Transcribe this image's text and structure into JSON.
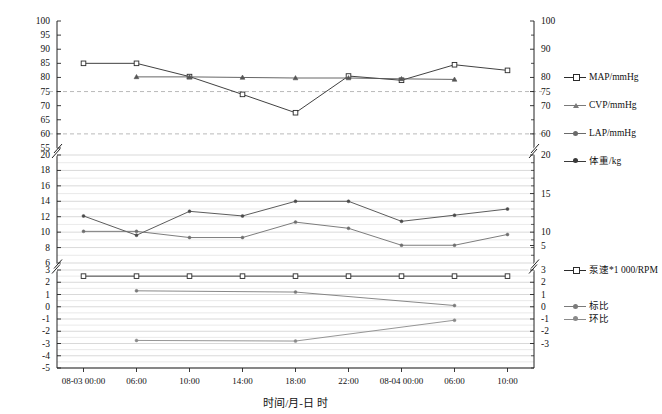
{
  "chart_data": {
    "type": "line",
    "title": "",
    "xlabel": "时间/月-日 时",
    "ylabel": "",
    "grid": true,
    "legend_position": "right",
    "broken_axis": true,
    "panels": [
      {
        "name": "blood-pressure",
        "ylim": [
          55,
          100
        ],
        "yticks": [
          55,
          60,
          65,
          70,
          75,
          80,
          85,
          90,
          95,
          100
        ],
        "yticks_right": [
          60,
          70,
          75,
          80,
          90,
          100
        ],
        "reference_lines": [
          75,
          60
        ]
      },
      {
        "name": "lap-weight",
        "ylim": [
          6,
          20
        ],
        "yticks": [
          6,
          8,
          10,
          12,
          14,
          16,
          18,
          20
        ],
        "yticks_right": [
          10,
          15,
          20
        ]
      },
      {
        "name": "pump-ratio",
        "ylim": [
          -5,
          3
        ],
        "yticks": [
          -5,
          -4,
          -3,
          -2,
          -1,
          0,
          1,
          2,
          3
        ],
        "yticks_right": [
          -3,
          -2,
          -1,
          0,
          1,
          2,
          3,
          5
        ]
      }
    ],
    "categories": [
      "08-03 00:00",
      "06:00",
      "10:00",
      "14:00",
      "18:00",
      "22:00",
      "08-04 00:00",
      "06:00",
      "10:00"
    ],
    "series": [
      {
        "name": "MAP/mmHg",
        "panel": "blood-pressure",
        "marker": "square",
        "color": "#2b2b2b",
        "values": [
          85,
          85,
          80.3,
          74,
          67.5,
          80.5,
          79,
          84.5,
          82.5
        ]
      },
      {
        "name": "CVP/mmHg",
        "panel": "blood-pressure",
        "marker": "triangle",
        "color": "#555555",
        "values": [
          null,
          80.2,
          80.2,
          80,
          79.8,
          79.8,
          79.5,
          79.3,
          null
        ]
      },
      {
        "name": "LAP/mmHg",
        "panel": "lap-weight",
        "marker": "dot",
        "color": "#4a4a4a",
        "values": [
          12.1,
          9.6,
          12.7,
          12.1,
          14,
          14,
          11.4,
          12.2,
          13
        ]
      },
      {
        "name": "体重/kg",
        "panel": "lap-weight",
        "marker": "dot",
        "color": "#6e6e6e",
        "values": [
          10.1,
          10.1,
          9.3,
          9.3,
          11.3,
          10.5,
          8.3,
          8.3,
          9.7
        ]
      },
      {
        "name": "泵速*1 000/RPM",
        "panel": "pump-ratio",
        "marker": "square",
        "color": "#2b2b2b",
        "values": [
          2.5,
          2.5,
          2.5,
          2.5,
          2.5,
          2.5,
          2.5,
          2.5,
          2.5
        ]
      },
      {
        "name": "标比",
        "panel": "pump-ratio",
        "marker": "dot",
        "color": "#7a7a7a",
        "values": [
          null,
          1.3,
          null,
          null,
          1.2,
          null,
          null,
          0.1,
          null
        ]
      },
      {
        "name": "环比",
        "panel": "pump-ratio",
        "marker": "dot",
        "color": "#8a8a8a",
        "values": [
          null,
          -2.75,
          null,
          null,
          -2.8,
          null,
          null,
          -1.1,
          null
        ]
      }
    ],
    "legend": [
      {
        "label": "MAP/mmHg",
        "marker": "square",
        "color": "#2b2b2b"
      },
      {
        "label": "CVP/mmHg",
        "marker": "triangle",
        "color": "#7a7a7a"
      },
      {
        "label": "LAP/mmHg",
        "marker": "dot",
        "color": "#6a6a6a"
      },
      {
        "label": "体重/kg",
        "marker": "dot",
        "color": "#3a3a3a"
      },
      {
        "label": "泵速*1 000/RPM",
        "marker": "square",
        "color": "#2b2b2b"
      },
      {
        "label": "标比",
        "marker": "dot",
        "color": "#7a7a7a"
      },
      {
        "label": "环比",
        "marker": "dot",
        "color": "#8a8a8a"
      }
    ]
  }
}
